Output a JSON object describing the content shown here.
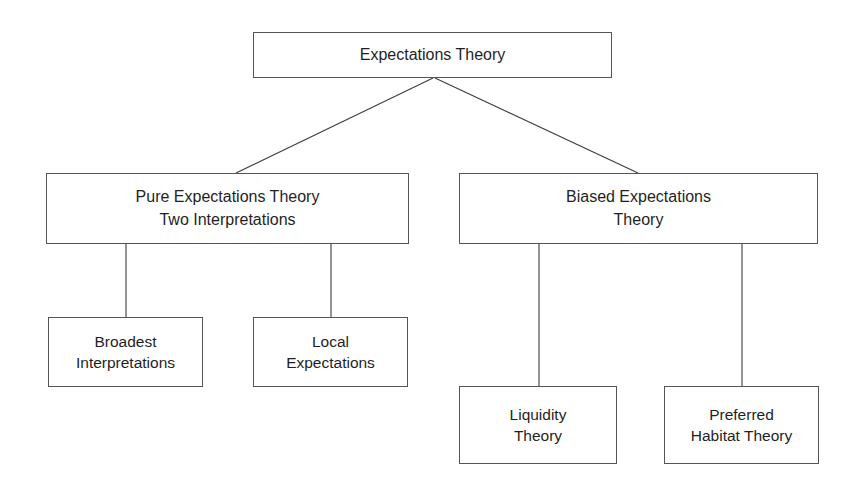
{
  "diagram": {
    "title": "Expectations Theory",
    "type": "hierarchy-tree",
    "orientation": "top-down",
    "levels": 3,
    "colors": {
      "background": "#ffffff",
      "box_border": "#555555",
      "box_fill": "#ffffff",
      "text": "#1f1f1f",
      "connector": "#3c3c3c"
    },
    "nodes": {
      "root": {
        "id": "expectations-theory",
        "lines": [
          "Expectations Theory"
        ],
        "level": 1
      },
      "pure": {
        "id": "pure-expectations-theory",
        "lines": [
          "Pure Expectations Theory",
          "Two Interpretations"
        ],
        "level": 2
      },
      "biased": {
        "id": "biased-expectations-theory",
        "lines": [
          "Biased Expectations",
          "Theory"
        ],
        "level": 2
      },
      "broadest": {
        "id": "broadest-interpretations",
        "lines": [
          "Broadest",
          "Interpretations"
        ],
        "level": 3
      },
      "local": {
        "id": "local-expectations",
        "lines": [
          "Local",
          "Expectations"
        ],
        "level": 3
      },
      "liquidity": {
        "id": "liquidity-theory",
        "lines": [
          "Liquidity",
          "Theory"
        ],
        "level": 3
      },
      "preferred": {
        "id": "preferred-habitat-theory",
        "lines": [
          "Preferred",
          "Habitat Theory"
        ],
        "level": 3
      }
    },
    "edges": [
      {
        "from": "expectations-theory",
        "to": "pure-expectations-theory",
        "style": "diagonal"
      },
      {
        "from": "expectations-theory",
        "to": "biased-expectations-theory",
        "style": "diagonal"
      },
      {
        "from": "pure-expectations-theory",
        "to": "broadest-interpretations",
        "style": "vertical"
      },
      {
        "from": "pure-expectations-theory",
        "to": "local-expectations",
        "style": "vertical"
      },
      {
        "from": "biased-expectations-theory",
        "to": "liquidity-theory",
        "style": "vertical"
      },
      {
        "from": "biased-expectations-theory",
        "to": "preferred-habitat-theory",
        "style": "vertical"
      }
    ]
  }
}
